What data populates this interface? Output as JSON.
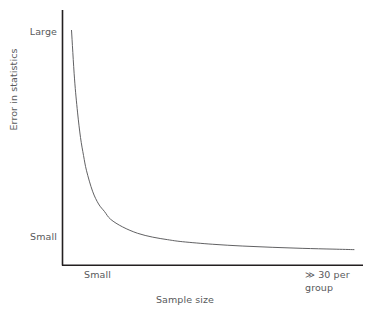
{
  "chart_data": {
    "type": "line",
    "title": "",
    "xlabel": "Sample size",
    "ylabel": "Error in statistics",
    "grid": false,
    "legend": null,
    "xlim": [
      0,
      100
    ],
    "ylim": [
      0,
      100
    ],
    "xticks": [
      {
        "value": 12,
        "label": "Small"
      }
    ],
    "yticks": [
      {
        "value": 92,
        "label": "Large"
      },
      {
        "value": 7,
        "label": "Small"
      }
    ],
    "annotations": [
      {
        "text_line_1": "≫ 30 per",
        "text_line_2": "group",
        "x": 96,
        "y": -8
      }
    ],
    "series": [
      {
        "name": "error-decay",
        "description": "Monotonic decreasing inverse-power decay curve",
        "x": [
          3,
          4,
          5,
          6,
          7,
          8,
          10,
          12,
          14,
          16,
          20,
          25,
          30,
          35,
          40,
          50,
          60,
          70,
          80,
          90,
          97
        ],
        "y": [
          92,
          73,
          60,
          50,
          43,
          37,
          29,
          24,
          21,
          18,
          15,
          12.5,
          11,
          10,
          9.2,
          8.2,
          7.5,
          7.0,
          6.6,
          6.3,
          6.1
        ]
      }
    ]
  },
  "axes": {
    "x_tick_small_label": "Small",
    "y_tick_large_label": "Large",
    "y_tick_small_label": "Small",
    "x_title": "Sample size",
    "y_title": "Error in statistics",
    "annotation_line_1": "≫ 30 per",
    "annotation_line_2": "group"
  },
  "colors": {
    "axis": "#231f20",
    "curve": "#58595b",
    "text": "#58595b",
    "background": "#ffffff"
  }
}
